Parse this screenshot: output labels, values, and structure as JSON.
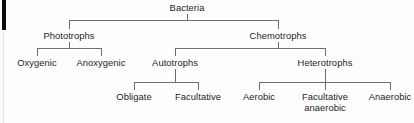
{
  "diagram": {
    "type": "hierarchy-tree",
    "colors": {
      "background": "#fdfdfd",
      "text": "#1d1d1d",
      "connector": "#6f6f6f",
      "edge_marker": "#0d0d0d",
      "edge_faint": "#e2e2e2"
    },
    "nodes": {
      "root": "Bacteria",
      "level2": {
        "phototrophs": "Phototrophs",
        "chemotrophs": "Chemotrophs"
      },
      "level3": {
        "oxygenic": "Oxygenic",
        "anoxygenic": "Anoxygenic",
        "autotrophs": "Autotrophs",
        "heterotrophs": "Heterotrophs"
      },
      "level4": {
        "obligate": "Obligate",
        "facultative": "Facultative",
        "aerobic": "Aerobic",
        "facultative_anaerobic": "Facultative\nanaerobic",
        "anaerobic": "Anaerobic"
      }
    }
  }
}
